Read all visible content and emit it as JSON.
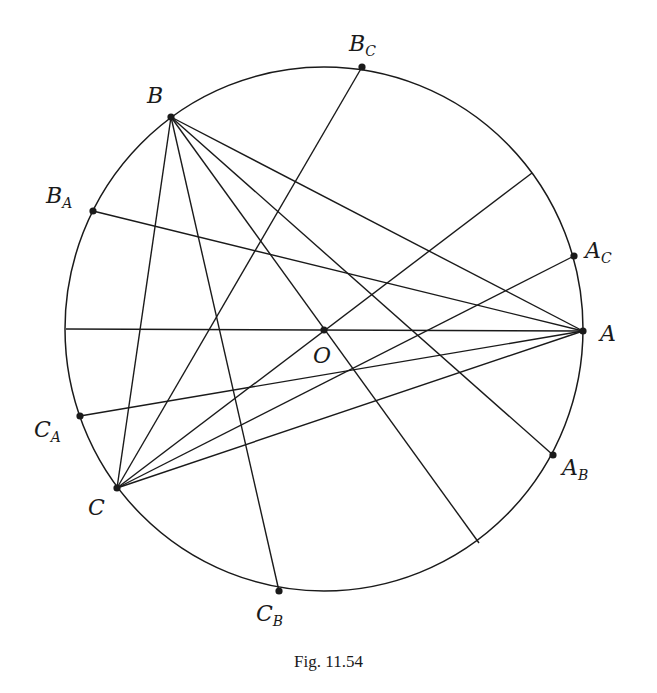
{
  "figure": {
    "caption": "Fig. 11.54",
    "circle": {
      "cx": 324,
      "cy": 329,
      "rx": 259,
      "ry": 262
    },
    "stroke_color": "#1a1a1a",
    "points": [
      {
        "id": "A",
        "name": "A",
        "sub": "",
        "x": 583,
        "y": 331,
        "lx": 600,
        "ly": 323
      },
      {
        "id": "B",
        "name": "B",
        "sub": "",
        "x": 171,
        "y": 117,
        "lx": 147,
        "ly": 85
      },
      {
        "id": "C",
        "name": "C",
        "sub": "",
        "x": 117,
        "y": 488,
        "lx": 88,
        "ly": 497
      },
      {
        "id": "O",
        "name": "O",
        "sub": "",
        "x": 324,
        "y": 330,
        "lx": 313,
        "ly": 345
      },
      {
        "id": "BC",
        "name": "B",
        "sub": "C",
        "x": 362,
        "y": 67,
        "lx": 349,
        "ly": 33
      },
      {
        "id": "BA",
        "name": "B",
        "sub": "A",
        "x": 93,
        "y": 211,
        "lx": 46,
        "ly": 185
      },
      {
        "id": "AC",
        "name": "A",
        "sub": "C",
        "x": 574,
        "y": 256,
        "lx": 585,
        "ly": 240
      },
      {
        "id": "AB",
        "name": "A",
        "sub": "B",
        "x": 553,
        "y": 455,
        "lx": 562,
        "ly": 457
      },
      {
        "id": "CA",
        "name": "C",
        "sub": "A",
        "x": 80,
        "y": 416,
        "lx": 34,
        "ly": 419
      },
      {
        "id": "CB",
        "name": "C",
        "sub": "B",
        "x": 279,
        "y": 591,
        "lx": 256,
        "ly": 603
      }
    ],
    "segments": [
      {
        "from": [
          66,
          329
        ],
        "to": [
          583,
          331
        ]
      },
      {
        "from": [
          362,
          67
        ],
        "to": [
          117,
          488
        ]
      },
      {
        "from": [
          93,
          211
        ],
        "to": [
          583,
          331
        ]
      },
      {
        "from": [
          80,
          416
        ],
        "to": [
          583,
          331
        ]
      },
      {
        "from": [
          574,
          256
        ],
        "to": [
          117,
          488
        ]
      },
      {
        "from": [
          532,
          173
        ],
        "to": [
          117,
          488
        ]
      },
      {
        "from": [
          117,
          488
        ],
        "to": [
          583,
          331
        ]
      },
      {
        "from": [
          171,
          117
        ],
        "to": [
          583,
          331
        ]
      },
      {
        "from": [
          171,
          117
        ],
        "to": [
          553,
          455
        ]
      },
      {
        "from": [
          171,
          117
        ],
        "to": [
          479,
          543
        ]
      },
      {
        "from": [
          171,
          117
        ],
        "to": [
          279,
          591
        ]
      },
      {
        "from": [
          171,
          117
        ],
        "to": [
          117,
          488
        ]
      }
    ]
  }
}
